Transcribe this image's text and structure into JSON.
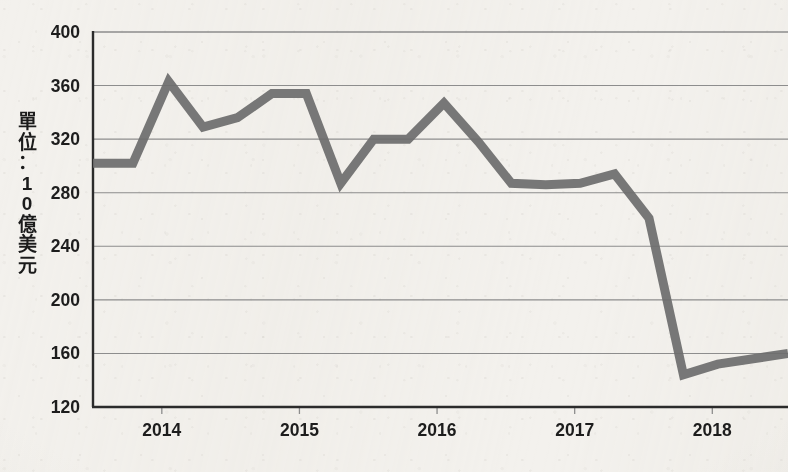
{
  "chart_data": {
    "type": "line",
    "title": "",
    "subtitle": "",
    "xlabel": "",
    "ylabel": "單位：10億美元",
    "ylabel_chars": [
      "單",
      "位",
      "：",
      "1",
      "0",
      "億",
      "美",
      "元"
    ],
    "ylim": [
      120,
      400
    ],
    "ytick_values": [
      120,
      160,
      200,
      240,
      280,
      320,
      360,
      400
    ],
    "ytick_labels": [
      "120",
      "160",
      "200",
      "240",
      "280",
      "320",
      "360",
      "400"
    ],
    "xtick_labels": [
      "2014",
      "2015",
      "2016",
      "2017",
      "2018"
    ],
    "xtick_values": [
      2014,
      2015,
      2016,
      2017,
      2018
    ],
    "xlim": [
      2013.5,
      2018.55
    ],
    "grid": "horizontal",
    "legend": "none",
    "series": [
      {
        "name": "",
        "color": "#6d6d6d",
        "line_width": 9,
        "x": [
          2013.5,
          2013.79,
          2014.05,
          2014.3,
          2014.55,
          2014.8,
          2015.05,
          2015.3,
          2015.54,
          2015.79,
          2016.05,
          2016.3,
          2016.54,
          2016.79,
          2017.04,
          2017.29,
          2017.54,
          2017.79,
          2018.04,
          2018.55
        ],
        "values": [
          302,
          302,
          363,
          329,
          336,
          354,
          354,
          287,
          320,
          320,
          347,
          318,
          287,
          286,
          287,
          294,
          261,
          144,
          152,
          160
        ]
      }
    ],
    "colors": {
      "line": "#6d6d6d",
      "axis": "#2b2b2b",
      "gridline": "#8d8d8d",
      "background": "#f3f1ed",
      "text": "#1d1d1d"
    },
    "geometry": {
      "plot_left": 93,
      "plot_right": 788,
      "plot_top": 32,
      "plot_bottom": 407
    }
  }
}
